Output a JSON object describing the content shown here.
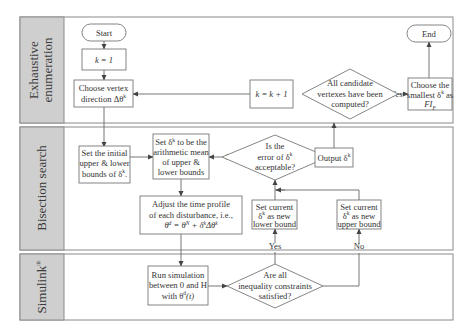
{
  "lanes": [
    {
      "id": "exhaustive",
      "label_line1": "Exhaustive",
      "label_line2": "enumeration"
    },
    {
      "id": "bisection",
      "label": "Bisection search"
    },
    {
      "id": "simulink",
      "label": "Simulink",
      "label_sup": "®"
    }
  ],
  "nodes": {
    "start": {
      "text": "Start"
    },
    "end": {
      "text": "End"
    },
    "k_init": {
      "text": "k = 1"
    },
    "choose_vertex": {
      "line1": "Choose vertex",
      "line2": "direction Δθ",
      "line2_sup": "k"
    },
    "k_increment": {
      "text": "k = k + 1"
    },
    "all_computed": {
      "line1": "All candidate",
      "line2": "vertexes have been",
      "line3": "computed?"
    },
    "choose_smallest": {
      "line1": "Choose the",
      "line2": "smallest δ",
      "line2_sup": "k",
      "line2_tail": " as",
      "line3": "FI",
      "line3_sub": "F"
    },
    "set_initial": {
      "line1": "Set the initial",
      "line2": "upper & lower",
      "line3": "bounds of δ",
      "line3_sup": "k",
      "line3_tail": "."
    },
    "set_mean": {
      "line1_pre": "Set δ",
      "line1_sup": "k",
      "line1_post": " to be the",
      "line2": "arithmetic mean",
      "line3": "of upper &",
      "line4": "lower bounds"
    },
    "error_ok": {
      "line1": "Is the",
      "line2_pre": "error of δ",
      "line2_sup": "k",
      "line3": "acceptable?"
    },
    "output": {
      "pre": "Output δ",
      "sup": "k"
    },
    "set_lower": {
      "line1": "Set current",
      "line2_pre": "δ",
      "line2_sup": "k",
      "line2_post": " as new",
      "line3": "lower bound"
    },
    "set_upper": {
      "line1": "Set current",
      "line2_pre": "δ",
      "line2_sup": "k",
      "line2_post": " as new",
      "line3": "upper bound"
    },
    "adjust_profile": {
      "line1": "Adjust the time profile",
      "line2": "of each disturbance, i.e.,",
      "line3": "θ",
      "line3_sup": "d",
      "line3_mid": " = θ",
      "line3_sup2": "N",
      "line3_mid2": " + δ",
      "line3_sup3": "k",
      "line3_tail": "Δθ",
      "line3_sup4": "k"
    },
    "run_sim": {
      "line1": "Run simulation",
      "line2": "between 0 and H",
      "line3_pre": "with θ",
      "line3_sup": "d",
      "line3_post": "(t)"
    },
    "constraints_ok": {
      "line1": "Are all",
      "line2": "inequality constraints",
      "line3": "satisfied?"
    }
  },
  "edge_labels": {
    "no_all_computed": "No",
    "yes_all_computed": "Yes",
    "no_error": "No",
    "yes_error": "Yes",
    "yes_constraints": "Yes",
    "no_constraints": "No"
  }
}
